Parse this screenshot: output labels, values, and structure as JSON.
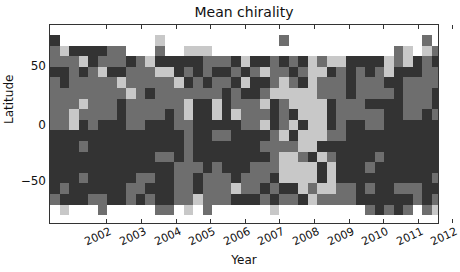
{
  "chart_data": {
    "type": "heatmap",
    "title": "Mean chirality",
    "xlabel": "Year",
    "ylabel": "Latitude",
    "xtick_labels": [
      "2002",
      "2003",
      "2004",
      "2005",
      "2006",
      "2007",
      "2008",
      "2009",
      "2010",
      "2011",
      "2012"
    ],
    "ytick_labels": [
      "50",
      "0",
      "−50"
    ],
    "ytick_values": [
      50,
      0,
      -50
    ],
    "xlim": [
      2001.3,
      2012.5
    ],
    "ylim": [
      -90,
      90
    ],
    "colormap": "grayscale (white=0, light, mid, dark)",
    "levels": {
      "0": "#ffffff",
      "1": "#c8c8c8",
      "2": "#6e6e6e",
      "3": "#333333"
    },
    "grid": false,
    "n_cols": 41,
    "n_rows": 17,
    "rows_top_to_bottom": [
      "30000000000100000000000020000000000000020",
      "21333322000200111000000000000000000021012",
      "22213222321333332223133232312113333121323",
      "33232133222113232332321223211323232133322",
      "23222221222221323223133212312223222332222",
      "22222222123222222232332111112223222232223",
      "22212223222222133132221321111322233332223",
      "22122223222232133131222323111322222332232",
      "22132333223332233333221321311323322333333",
      "33333333333333233223333213111223333333333",
      "33323333333333233333332222113333333333333",
      "33333333333223233333333211231233332333333",
      "33333333333332223233322211113133323333333",
      "33323333322332232223222311113133333333332",
      "32333333223332232221223233121122323322233",
      "23332233232332212223332322312222333333232",
      "01000200000220102000000100000000023232021"
    ]
  },
  "title": "Mean chirality"
}
